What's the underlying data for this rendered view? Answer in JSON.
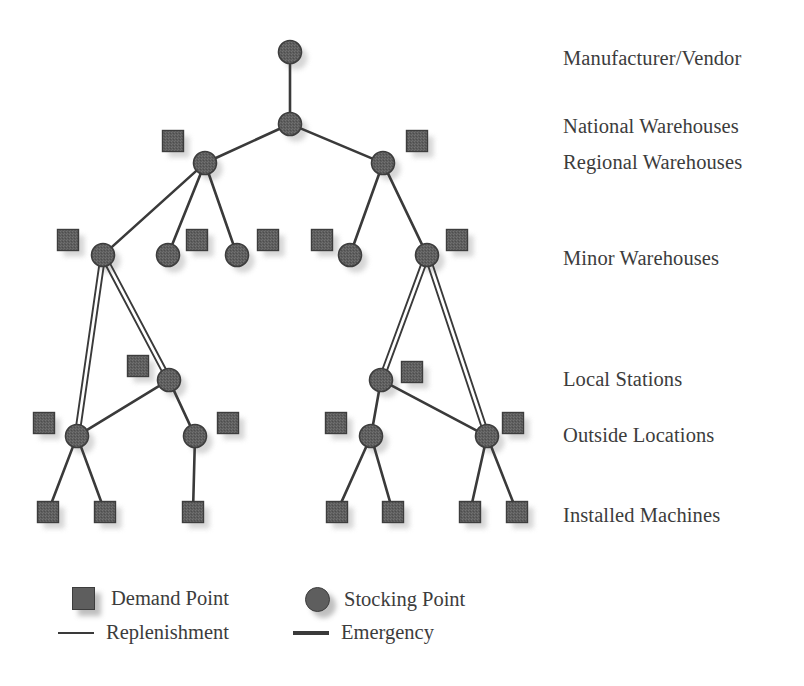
{
  "figure": {
    "type": "network-diagram",
    "title_partial_cropped": "",
    "background_color": "#ffffff",
    "node_fill": "#5e5e5e",
    "node_stroke": "#3d3d3d",
    "shadow_color": "#cfcfcf",
    "line_color": "#3a3a3a"
  },
  "tier_labels": [
    {
      "id": "manufacturer-vendor",
      "label": "Manufacturer/Vendor",
      "x": 563,
      "y": 47
    },
    {
      "id": "national-warehouses",
      "label": "National Warehouses",
      "x": 563,
      "y": 115
    },
    {
      "id": "regional-warehouses",
      "label": "Regional Warehouses",
      "x": 563,
      "y": 151
    },
    {
      "id": "minor-warehouses",
      "label": "Minor Warehouses",
      "x": 563,
      "y": 247
    },
    {
      "id": "local-stations",
      "label": "Local Stations",
      "x": 563,
      "y": 368
    },
    {
      "id": "outside-locations",
      "label": "Outside Locations",
      "x": 563,
      "y": 424
    },
    {
      "id": "installed-machines",
      "label": "Installed Machines",
      "x": 563,
      "y": 504
    }
  ],
  "legend": {
    "items": [
      {
        "id": "demand-point",
        "glyph": "square",
        "label": "Demand Point",
        "x": 72,
        "y": 587
      },
      {
        "id": "stocking-point",
        "glyph": "circle",
        "label": "Stocking Point",
        "x": 305,
        "y": 587
      },
      {
        "id": "replenishment",
        "glyph": "line-single",
        "label": "Replenishment",
        "x": 72,
        "y": 621
      },
      {
        "id": "emergency",
        "glyph": "line-double",
        "label": "Emergency",
        "x": 305,
        "y": 621
      }
    ]
  },
  "chart_data": {
    "type": "diagram",
    "stocking_points": [
      {
        "id": "sp-mv",
        "tier": "manufacturer-vendor",
        "x": 290,
        "y": 52
      },
      {
        "id": "sp-nw",
        "tier": "national-warehouses",
        "x": 290,
        "y": 124
      },
      {
        "id": "sp-rw-l",
        "tier": "regional-warehouses",
        "x": 205,
        "y": 163
      },
      {
        "id": "sp-rw-r",
        "tier": "regional-warehouses",
        "x": 383,
        "y": 163
      },
      {
        "id": "sp-mw-1",
        "tier": "minor-warehouses",
        "x": 103,
        "y": 255
      },
      {
        "id": "sp-mw-2",
        "tier": "minor-warehouses",
        "x": 168,
        "y": 255
      },
      {
        "id": "sp-mw-3",
        "tier": "minor-warehouses",
        "x": 237,
        "y": 255
      },
      {
        "id": "sp-mw-4",
        "tier": "minor-warehouses",
        "x": 350,
        "y": 255
      },
      {
        "id": "sp-mw-5",
        "tier": "minor-warehouses",
        "x": 427,
        "y": 255
      },
      {
        "id": "sp-ls-l",
        "tier": "local-stations",
        "x": 169,
        "y": 380
      },
      {
        "id": "sp-ls-r",
        "tier": "local-stations",
        "x": 381,
        "y": 380
      },
      {
        "id": "sp-ol-1",
        "tier": "outside-locations",
        "x": 77,
        "y": 436
      },
      {
        "id": "sp-ol-2",
        "tier": "outside-locations",
        "x": 195,
        "y": 436
      },
      {
        "id": "sp-ol-3",
        "tier": "outside-locations",
        "x": 371,
        "y": 436
      },
      {
        "id": "sp-ol-4",
        "tier": "outside-locations",
        "x": 487,
        "y": 436
      }
    ],
    "demand_points": [
      {
        "id": "dp-nw-l",
        "tier": "national-warehouses",
        "x": 173,
        "y": 141
      },
      {
        "id": "dp-nw-r",
        "tier": "national-warehouses",
        "x": 417,
        "y": 141
      },
      {
        "id": "dp-mw-1",
        "tier": "minor-warehouses",
        "x": 68,
        "y": 240
      },
      {
        "id": "dp-mw-2",
        "tier": "minor-warehouses",
        "x": 197,
        "y": 240
      },
      {
        "id": "dp-mw-3",
        "tier": "minor-warehouses",
        "x": 268,
        "y": 240
      },
      {
        "id": "dp-mw-4",
        "tier": "minor-warehouses",
        "x": 322,
        "y": 240
      },
      {
        "id": "dp-mw-5",
        "tier": "minor-warehouses",
        "x": 457,
        "y": 240
      },
      {
        "id": "dp-ls-l",
        "tier": "local-stations",
        "x": 138,
        "y": 366
      },
      {
        "id": "dp-ls-r",
        "tier": "local-stations",
        "x": 412,
        "y": 372
      },
      {
        "id": "dp-ol-1",
        "tier": "outside-locations",
        "x": 44,
        "y": 423
      },
      {
        "id": "dp-ol-2",
        "tier": "outside-locations",
        "x": 228,
        "y": 423
      },
      {
        "id": "dp-ol-3",
        "tier": "outside-locations",
        "x": 336,
        "y": 423
      },
      {
        "id": "dp-ol-4",
        "tier": "outside-locations",
        "x": 513,
        "y": 423
      },
      {
        "id": "dp-im-1",
        "tier": "installed-machines",
        "x": 48,
        "y": 512
      },
      {
        "id": "dp-im-2",
        "tier": "installed-machines",
        "x": 105,
        "y": 512
      },
      {
        "id": "dp-im-3",
        "tier": "installed-machines",
        "x": 193,
        "y": 512
      },
      {
        "id": "dp-im-4",
        "tier": "installed-machines",
        "x": 337,
        "y": 512
      },
      {
        "id": "dp-im-5",
        "tier": "installed-machines",
        "x": 393,
        "y": 512
      },
      {
        "id": "dp-im-6",
        "tier": "installed-machines",
        "x": 470,
        "y": 512
      },
      {
        "id": "dp-im-7",
        "tier": "installed-machines",
        "x": 517,
        "y": 512
      }
    ],
    "replenishment_links": [
      [
        "sp-mv",
        "sp-nw"
      ],
      [
        "sp-nw",
        "sp-rw-l"
      ],
      [
        "sp-nw",
        "sp-rw-r"
      ],
      [
        "sp-rw-l",
        "sp-mw-1"
      ],
      [
        "sp-rw-l",
        "sp-mw-2"
      ],
      [
        "sp-rw-l",
        "sp-mw-3"
      ],
      [
        "sp-rw-r",
        "sp-mw-4"
      ],
      [
        "sp-rw-r",
        "sp-mw-5"
      ],
      [
        "sp-ls-l",
        "sp-ol-1"
      ],
      [
        "sp-ls-l",
        "sp-ol-2"
      ],
      [
        "sp-ls-r",
        "sp-ol-3"
      ],
      [
        "sp-ls-r",
        "sp-ol-4"
      ],
      [
        "sp-ol-1",
        "dp-im-1"
      ],
      [
        "sp-ol-1",
        "dp-im-2"
      ],
      [
        "sp-ol-2",
        "dp-im-3"
      ],
      [
        "sp-ol-3",
        "dp-im-4"
      ],
      [
        "sp-ol-3",
        "dp-im-5"
      ],
      [
        "sp-ol-4",
        "dp-im-6"
      ],
      [
        "sp-ol-4",
        "dp-im-7"
      ]
    ],
    "emergency_links": [
      [
        "sp-mw-1",
        "sp-ls-l"
      ],
      [
        "sp-mw-1",
        "sp-ol-1"
      ],
      [
        "sp-mw-5",
        "sp-ls-r"
      ],
      [
        "sp-mw-5",
        "sp-ol-4"
      ]
    ],
    "demand_stubs": [
      [
        "sp-ls-l",
        "dp-ls-l"
      ],
      [
        "sp-ls-r",
        "dp-ls-r"
      ]
    ]
  }
}
